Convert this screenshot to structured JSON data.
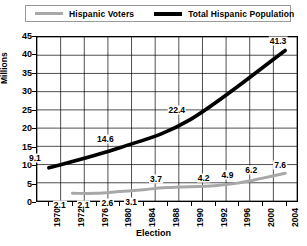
{
  "legend": {
    "position": "top",
    "entries": [
      {
        "label": "Hispanic Voters",
        "color": "#a8a8a8",
        "swatch": "gray-line-swatch"
      },
      {
        "label": "Total Hispanic Population",
        "color": "#000000",
        "swatch": "black-line-swatch"
      }
    ]
  },
  "chart_data": {
    "type": "line",
    "title": "",
    "xlabel": "Election",
    "ylabel": "Millions",
    "categories": [
      "1970",
      "1972",
      "1976",
      "1980",
      "1984",
      "1988",
      "1990",
      "1992",
      "1996",
      "2000",
      "2004"
    ],
    "ylim": [
      0,
      45
    ],
    "yticks": [
      0,
      5,
      10,
      15,
      20,
      25,
      30,
      35,
      40,
      45
    ],
    "grid": true,
    "legend_position": "top",
    "series": [
      {
        "name": "Hispanic Voters",
        "color": "#a8a8a8",
        "x": [
          "1972",
          "1976",
          "1980",
          "1984",
          "1988",
          "1992",
          "1996",
          "2000",
          "2004"
        ],
        "values": [
          2.1,
          2.1,
          2.6,
          3.1,
          3.7,
          4.2,
          4.9,
          6.2,
          7.6
        ],
        "labels": [
          "2.1",
          "2.1",
          "2.6",
          "3.1",
          "3.7",
          "4.2",
          "4.9",
          "6.2",
          "7.6"
        ]
      },
      {
        "name": "Total Hispanic Population",
        "color": "#000000",
        "x": [
          "1970",
          "1980",
          "1990",
          "2004"
        ],
        "values": [
          9.1,
          14.6,
          22.4,
          41.3
        ],
        "labels": [
          "9.1",
          "14.6",
          "22.4",
          "41.3"
        ]
      }
    ]
  }
}
